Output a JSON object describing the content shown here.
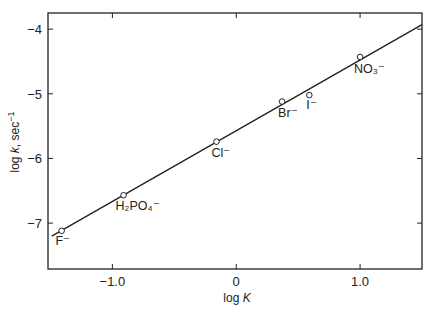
{
  "chart_data": {
    "type": "scatter",
    "title": "",
    "xlabel": "log K",
    "ylabel": "log k, sec⁻¹",
    "xlim": [
      -1.52,
      1.5
    ],
    "ylim": [
      -7.71,
      -3.75
    ],
    "grid": false,
    "legend": null,
    "x_ticks": [
      -1.0,
      0,
      1.0
    ],
    "x_tick_labels": [
      "−1.0",
      "0",
      "1.0"
    ],
    "y_ticks": [
      -4,
      -5,
      -6,
      -7
    ],
    "y_tick_labels": [
      "−4",
      "−5",
      "−6",
      "−7"
    ],
    "points": [
      {
        "label": "F⁻",
        "x": -1.41,
        "y": -7.12
      },
      {
        "label": "H₂PO₄⁻",
        "x": -0.91,
        "y": -6.57
      },
      {
        "label": "Cl⁻",
        "x": -0.16,
        "y": -5.74
      },
      {
        "label": "Br⁻",
        "x": 0.37,
        "y": -5.12
      },
      {
        "label": "I⁻",
        "x": 0.59,
        "y": -5.02
      },
      {
        "label": "NO₃⁻",
        "x": 1.0,
        "y": -4.43
      }
    ],
    "fit_line": {
      "x": [
        -1.49,
        1.5
      ],
      "y": [
        -7.2,
        -3.93
      ]
    }
  },
  "axes": {
    "xlabel_main": "log ",
    "xlabel_italic": "K",
    "ylabel_main": "log ",
    "ylabel_italic": "k",
    "ylabel_unit": ", sec",
    "ylabel_exp": "−1"
  },
  "colors": {
    "ink": "#222222",
    "background": "#ffffff"
  }
}
